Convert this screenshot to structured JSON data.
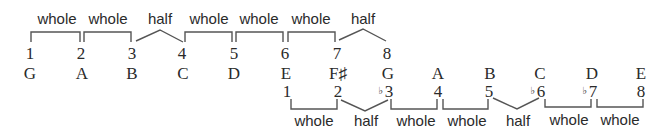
{
  "major_scale": {
    "degrees": [
      "1",
      "2",
      "3",
      "4",
      "5",
      "6",
      "7",
      "8"
    ],
    "notes": [
      "G",
      "A",
      "B",
      "C",
      "D",
      "E",
      "F♯",
      "G"
    ],
    "steps": [
      "whole",
      "whole",
      "half",
      "whole",
      "whole",
      "whole",
      "half"
    ]
  },
  "minor_scale": {
    "degrees": [
      {
        "flat": "",
        "num": "1"
      },
      {
        "flat": "",
        "num": "2"
      },
      {
        "flat": "♭",
        "num": "3"
      },
      {
        "flat": "",
        "num": "4"
      },
      {
        "flat": "",
        "num": "5"
      },
      {
        "flat": "♭",
        "num": "6"
      },
      {
        "flat": "♭",
        "num": "7"
      },
      {
        "flat": "",
        "num": "8"
      }
    ],
    "notes": [
      "E",
      "F♯",
      "G",
      "A",
      "B",
      "C",
      "D",
      "E"
    ],
    "steps": [
      "whole",
      "half",
      "whole",
      "whole",
      "half",
      "whole",
      "whole"
    ]
  },
  "colors": {
    "line": "#555555",
    "text": "#2a2a2a"
  }
}
